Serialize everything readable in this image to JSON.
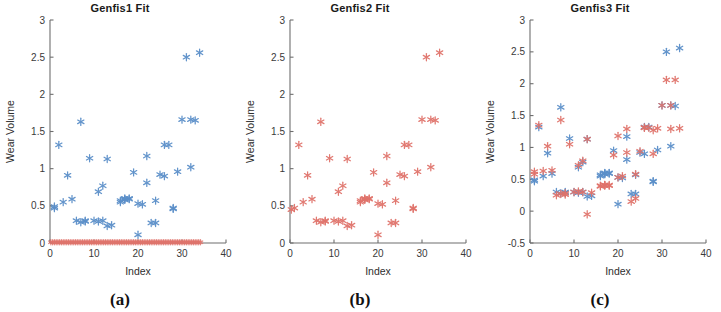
{
  "figure": {
    "panels": [
      {
        "id": "a",
        "title": "Genfis1 Fit",
        "subcaption": "(a)",
        "xlabel": "Index",
        "ylabel": "Wear Volume",
        "xlim": [
          0,
          40
        ],
        "ylim": [
          0,
          3
        ],
        "xticks": [
          0,
          10,
          20,
          30,
          40
        ],
        "xticklabels": [
          "0",
          "10",
          "20",
          "30",
          "40"
        ],
        "yticks": [
          0,
          0.5,
          1,
          1.5,
          2,
          2.5,
          3
        ],
        "yticklabels": [
          "0",
          "0.5",
          "1",
          "1.5",
          "2",
          "2.5",
          "3"
        ]
      },
      {
        "id": "b",
        "title": "Genfis2 Fit",
        "subcaption": "(b)",
        "xlabel": "Index",
        "ylabel": "Wear Volume",
        "xlim": [
          0,
          40
        ],
        "ylim": [
          0,
          3
        ],
        "xticks": [
          0,
          10,
          20,
          30,
          40
        ],
        "xticklabels": [
          "0",
          "10",
          "20",
          "30",
          "40"
        ],
        "yticks": [
          0,
          0.5,
          1,
          1.5,
          2,
          2.5,
          3
        ],
        "yticklabels": [
          "0",
          "0.5",
          "1",
          "1.5",
          "2",
          "2.5",
          "3"
        ]
      },
      {
        "id": "c",
        "title": "Genfis3 Fit",
        "subcaption": "(c)",
        "xlabel": "Index",
        "ylabel": "Wear Volume",
        "xlim": [
          0,
          40
        ],
        "ylim": [
          -0.5,
          3
        ],
        "xticks": [
          0,
          10,
          20,
          30,
          40
        ],
        "xticklabels": [
          "0",
          "10",
          "20",
          "30",
          "40"
        ],
        "yticks": [
          -0.5,
          0,
          0.5,
          1,
          1.5,
          2,
          2.5,
          3
        ],
        "yticklabels": [
          "-0.5",
          "0",
          "0.5",
          "1",
          "1.5",
          "2",
          "2.5",
          "3"
        ]
      }
    ]
  },
  "colors": {
    "observed": "#5b8fc9",
    "predicted": "#e0736b",
    "axis": "#6e6e6e",
    "text": "#333333",
    "background": "#ffffff"
  },
  "chart_data": [
    {
      "type": "scatter",
      "title": "Genfis1 Fit",
      "xlabel": "Index",
      "ylabel": "Wear Volume",
      "xlim": [
        0,
        40
      ],
      "ylim": [
        0,
        3
      ],
      "xticks": [
        0,
        10,
        20,
        30,
        40
      ],
      "yticks": [
        0,
        0.5,
        1,
        1.5,
        2,
        2.5,
        3
      ],
      "grid": false,
      "legend": null,
      "marker": "asterisk",
      "series": [
        {
          "name": "Observed",
          "color": "#5b8fc9",
          "x": [
            1,
            1,
            2,
            3,
            4,
            5,
            6,
            7,
            7,
            8,
            8,
            9,
            10,
            11,
            11,
            12,
            12,
            13,
            13,
            14,
            16,
            16,
            17,
            17,
            17,
            18,
            18,
            19,
            20,
            20,
            21,
            22,
            22,
            23,
            24,
            24,
            25,
            26,
            26,
            27,
            28,
            28,
            29,
            30,
            31,
            32,
            32,
            33,
            34
          ],
          "y": [
            0.47,
            0.49,
            1.32,
            0.55,
            0.91,
            0.59,
            0.3,
            0.28,
            1.63,
            0.3,
            0.29,
            1.14,
            0.3,
            0.69,
            0.29,
            0.77,
            0.3,
            0.23,
            1.13,
            0.24,
            0.55,
            0.57,
            0.58,
            0.59,
            0.6,
            0.59,
            0.6,
            0.95,
            0.11,
            0.53,
            0.52,
            0.81,
            1.17,
            0.27,
            0.57,
            0.27,
            0.92,
            0.9,
            1.32,
            1.32,
            0.47,
            0.46,
            0.96,
            1.66,
            2.5,
            1.66,
            1.02,
            1.65,
            2.56
          ]
        },
        {
          "name": "Predicted",
          "color": "#e0736b",
          "x": [
            0.2,
            0.6,
            1.0,
            1.4,
            1.8,
            2.2,
            2.6,
            3.0,
            3.4,
            3.8,
            4.2,
            4.6,
            5.0,
            5.4,
            5.8,
            6.2,
            6.6,
            7.0,
            7.4,
            7.8,
            8.2,
            8.6,
            9.0,
            9.4,
            9.8,
            10.2,
            10.6,
            11.0,
            11.4,
            11.8,
            12.2,
            12.6,
            13.0,
            13.4,
            13.8,
            14.2,
            14.6,
            15.0,
            15.4,
            15.8,
            16.2,
            16.6,
            17.0,
            17.4,
            17.8,
            18.2,
            18.6,
            19.0,
            19.4,
            19.8,
            20.2,
            20.6,
            21.0,
            21.4,
            21.8,
            22.2,
            22.6,
            23.0,
            23.4,
            23.8,
            24.2,
            24.6,
            25.0,
            25.4,
            25.8,
            26.2,
            26.6,
            27.0,
            27.4,
            27.8,
            28.2,
            28.6,
            29.0,
            29.4,
            29.8,
            30.2,
            30.6,
            31.0,
            31.4,
            31.8,
            32.2,
            32.6,
            33.0,
            33.4,
            33.8,
            34.2
          ],
          "y": [
            0.01,
            0.01,
            0.01,
            0.01,
            0.01,
            0.01,
            0.01,
            0.01,
            0.01,
            0.01,
            0.01,
            0.01,
            0.01,
            0.01,
            0.01,
            0.01,
            0.01,
            0.01,
            0.01,
            0.01,
            0.01,
            0.01,
            0.01,
            0.01,
            0.01,
            0.01,
            0.01,
            0.01,
            0.01,
            0.01,
            0.01,
            0.01,
            0.01,
            0.01,
            0.01,
            0.01,
            0.01,
            0.01,
            0.01,
            0.01,
            0.01,
            0.01,
            0.01,
            0.01,
            0.01,
            0.01,
            0.01,
            0.01,
            0.01,
            0.01,
            0.01,
            0.01,
            0.01,
            0.01,
            0.01,
            0.01,
            0.01,
            0.01,
            0.01,
            0.01,
            0.01,
            0.01,
            0.01,
            0.01,
            0.01,
            0.01,
            0.01,
            0.01,
            0.01,
            0.01,
            0.01,
            0.01,
            0.01,
            0.01,
            0.01,
            0.01,
            0.01,
            0.01,
            0.01,
            0.01,
            0.01,
            0.01,
            0.01,
            0.01,
            0.01,
            0.01
          ]
        }
      ]
    },
    {
      "type": "scatter",
      "title": "Genfis2 Fit",
      "xlabel": "Index",
      "ylabel": "Wear Volume",
      "xlim": [
        0,
        40
      ],
      "ylim": [
        0,
        3
      ],
      "xticks": [
        0,
        10,
        20,
        30,
        40
      ],
      "yticks": [
        0,
        0.5,
        1,
        1.5,
        2,
        2.5,
        3
      ],
      "grid": false,
      "legend": null,
      "marker": "asterisk",
      "series": [
        {
          "name": "Predicted",
          "color": "#e0736b",
          "x": [
            0.3,
            1,
            2,
            3,
            4,
            5,
            6,
            7,
            7,
            8,
            8,
            9,
            10,
            11,
            11,
            12,
            12,
            13,
            13,
            14,
            16,
            16,
            17,
            17,
            17,
            18,
            18,
            19,
            20,
            20,
            21,
            22,
            22,
            23,
            24,
            24,
            25,
            26,
            26,
            27,
            28,
            28,
            29,
            30,
            31,
            32,
            32,
            33,
            34
          ],
          "y": [
            0.45,
            0.47,
            1.32,
            0.55,
            0.91,
            0.59,
            0.3,
            0.28,
            1.63,
            0.3,
            0.29,
            1.14,
            0.3,
            0.69,
            0.29,
            0.77,
            0.3,
            0.23,
            1.13,
            0.24,
            0.55,
            0.57,
            0.58,
            0.59,
            0.6,
            0.59,
            0.6,
            0.95,
            0.11,
            0.53,
            0.52,
            0.81,
            1.17,
            0.27,
            0.57,
            0.27,
            0.92,
            0.9,
            1.32,
            1.32,
            0.47,
            0.46,
            0.96,
            1.66,
            2.5,
            1.66,
            1.02,
            1.65,
            2.56
          ]
        }
      ]
    },
    {
      "type": "scatter",
      "title": "Genfis3 Fit",
      "xlabel": "Index",
      "ylabel": "Wear Volume",
      "xlim": [
        0,
        40
      ],
      "ylim": [
        -0.5,
        3
      ],
      "xticks": [
        0,
        10,
        20,
        30,
        40
      ],
      "yticks": [
        -0.5,
        0,
        0.5,
        1,
        1.5,
        2,
        2.5,
        3
      ],
      "grid": false,
      "legend": null,
      "marker": "asterisk",
      "series": [
        {
          "name": "Observed",
          "color": "#5b8fc9",
          "x": [
            1,
            1,
            2,
            3,
            4,
            5,
            6,
            7,
            7,
            8,
            8,
            9,
            10,
            11,
            11,
            12,
            12,
            13,
            13,
            14,
            16,
            16,
            17,
            17,
            17,
            18,
            18,
            19,
            20,
            20,
            21,
            22,
            22,
            23,
            24,
            24,
            25,
            26,
            26,
            27,
            28,
            28,
            29,
            30,
            31,
            32,
            32,
            33,
            34
          ],
          "y": [
            0.47,
            0.49,
            1.32,
            0.55,
            0.91,
            0.59,
            0.3,
            0.28,
            1.63,
            0.3,
            0.29,
            1.14,
            0.3,
            0.69,
            0.29,
            0.77,
            0.3,
            0.23,
            1.13,
            0.24,
            0.55,
            0.57,
            0.58,
            0.59,
            0.6,
            0.59,
            0.6,
            0.95,
            0.11,
            0.53,
            0.52,
            0.81,
            1.17,
            0.27,
            0.57,
            0.27,
            0.92,
            0.9,
            1.32,
            1.32,
            0.47,
            0.46,
            0.96,
            1.66,
            2.5,
            1.66,
            1.02,
            1.65,
            2.56
          ]
        },
        {
          "name": "Predicted",
          "color": "#e0736b",
          "x": [
            1,
            1,
            2,
            3,
            4,
            5,
            6,
            7,
            7,
            8,
            8,
            9,
            10,
            11,
            11,
            12,
            12,
            13,
            13,
            14,
            16,
            16,
            17,
            17,
            17,
            18,
            18,
            19,
            20,
            20,
            21,
            22,
            22,
            23,
            24,
            24,
            25,
            26,
            26,
            27,
            28,
            28,
            29,
            30,
            31,
            32,
            32,
            33,
            34
          ],
          "y": [
            0.62,
            0.58,
            1.35,
            0.63,
            1.02,
            0.64,
            0.25,
            0.27,
            1.43,
            0.26,
            0.28,
            1.05,
            0.3,
            0.72,
            0.31,
            0.79,
            0.3,
            -0.05,
            1.13,
            0.29,
            0.39,
            0.4,
            0.4,
            0.41,
            0.41,
            0.4,
            0.41,
            0.88,
            1.18,
            0.53,
            0.55,
            0.92,
            1.29,
            0.15,
            0.58,
            0.2,
            0.94,
            1.31,
            1.31,
            1.31,
            1.27,
            0.9,
            1.3,
            1.66,
            2.06,
            1.66,
            1.29,
            2.06,
            1.3
          ]
        }
      ]
    }
  ]
}
